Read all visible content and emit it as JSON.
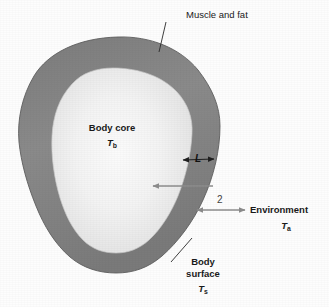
{
  "figure": {
    "background_color": "#fdfdfd"
  },
  "regions": {
    "outer_layer": {
      "label": "Muscle and fat",
      "fill_color": "#858585",
      "fill_color_dark": "#6f6f6f"
    },
    "core": {
      "label": "Body core",
      "symbol_letter": "T",
      "symbol_subscript": "b",
      "fill_color": "#f4f4f4",
      "fill_color_edge": "#d7d7d7"
    }
  },
  "labels": {
    "muscle_and_fat": "Muscle and fat",
    "body_core": "Body core",
    "body_core_symbol_letter": "T",
    "body_core_symbol_subscript": "b",
    "thickness": "L",
    "flux_number": "2",
    "environment": "Environment",
    "environment_symbol_letter": "T",
    "environment_symbol_subscript": "a",
    "body_surface_line1": "Body",
    "body_surface_line2": "surface",
    "body_surface_symbol_letter": "T",
    "body_surface_symbol_subscript": "s"
  },
  "colors": {
    "leader_line": "#2a2a2a",
    "arrow_gray": "#8c8c8c",
    "arrow_dark": "#222222",
    "text": "#1a1a1a"
  }
}
